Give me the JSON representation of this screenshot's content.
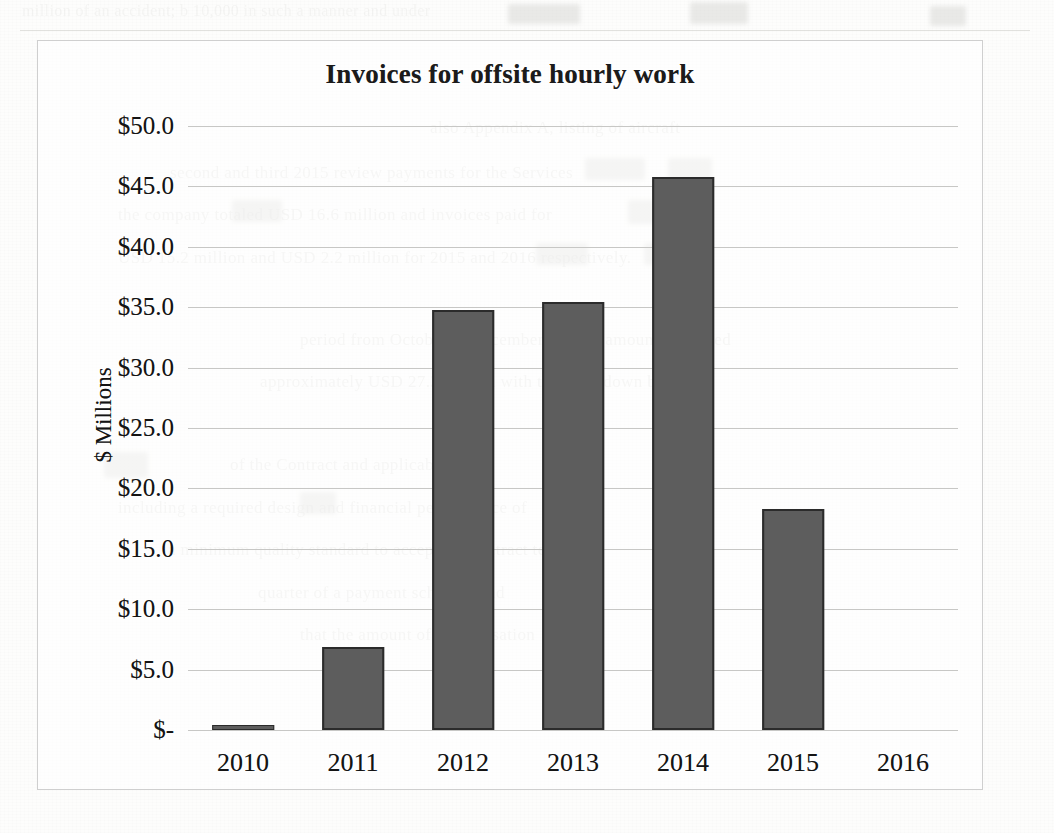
{
  "page": {
    "background_color": "#fdfdfc",
    "scan_artifact": "photocopied document page with faint ghost text bleeding through behind and around the chart"
  },
  "ghost_text": {
    "top_band": [
      "million    of an accident; b 10,000 in such a manner and under"
    ],
    "left_margin": [
      "",
      "",
      ""
    ],
    "right_body": [
      "also Appendix A, listing of aircraft",
      "second and third 2015 review payments for the Services",
      "the company totaled USD 16.6 million and invoices paid for",
      "USD 15.2 million and USD 2.2 million for 2015 and 2016 respectively.",
      "",
      "period from October to December and the amounts received",
      "approximately USD 27.3 million with the breakdown below:",
      "",
      "",
      "of the Contract and applicable work",
      "including a required design and financial performance of",
      "a minimum quality standard to accept the contract terms",
      "quarter of a payment schedule and",
      "that the amount of compensation"
    ]
  },
  "chart_frame": {
    "border_color": "#cfcfcf"
  },
  "chart_data": {
    "type": "bar",
    "title": "Invoices for offsite hourly work",
    "xlabel": "",
    "ylabel": "$ Millions",
    "categories": [
      "2010",
      "2011",
      "2012",
      "2013",
      "2014",
      "2015",
      "2016"
    ],
    "values": [
      0.4,
      6.9,
      34.8,
      35.4,
      45.8,
      18.3,
      0.0
    ],
    "series": [
      {
        "name": "Invoices",
        "values": [
          0.4,
          6.9,
          34.8,
          35.4,
          45.8,
          18.3,
          0.0
        ]
      }
    ],
    "ylim": [
      0,
      50
    ],
    "ytick_values": [
      0,
      5,
      10,
      15,
      20,
      25,
      30,
      35,
      40,
      45,
      50
    ],
    "ytick_labels": [
      "$-",
      "$5.0",
      "$10.0",
      "$15.0",
      "$20.0",
      "$25.0",
      "$30.0",
      "$35.0",
      "$40.0",
      "$45.0",
      "$50.0"
    ],
    "grid": true,
    "grid_color": "#c4c4c2",
    "legend": false,
    "legend_position": "none",
    "bar_fill_color": "#5d5d5d",
    "bar_border_color": "#2b2b2b",
    "units": "millions of USD"
  }
}
